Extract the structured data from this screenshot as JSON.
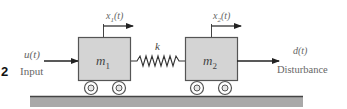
{
  "figure": {
    "number_label": "2",
    "colors": {
      "block_fill": "#d4d4d4",
      "block_stroke": "#555555",
      "line": "#222222",
      "ground_fill": "#a9a9a9",
      "ground_top": "#444444",
      "label_text": "#666666"
    },
    "input": {
      "symbol": "u(t)",
      "caption": "Input"
    },
    "mass1": {
      "symbol": "m",
      "subscript": "1",
      "displacement": "x",
      "displacement_sub": "1",
      "displacement_arg": "(t)"
    },
    "spring": {
      "symbol": "k"
    },
    "mass2": {
      "symbol": "m",
      "subscript": "2",
      "displacement": "x",
      "displacement_sub": "2",
      "displacement_arg": "(t)"
    },
    "disturbance": {
      "symbol": "d(t)",
      "caption": "Disturbance"
    }
  }
}
